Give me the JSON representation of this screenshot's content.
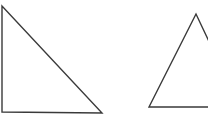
{
  "diagram": {
    "background": "#ffffff",
    "stroke_color": "#3a3a3a",
    "stroke_width": 1.4,
    "shapes": [
      {
        "name": "right-triangle",
        "type": "triangle",
        "points": [
          [
            2,
            6
          ],
          [
            2,
            112
          ],
          [
            102,
            113
          ]
        ]
      },
      {
        "name": "acute-triangle",
        "type": "triangle",
        "points": [
          [
            196,
            14
          ],
          [
            149,
            107
          ],
          [
            240,
            107
          ]
        ]
      }
    ]
  }
}
